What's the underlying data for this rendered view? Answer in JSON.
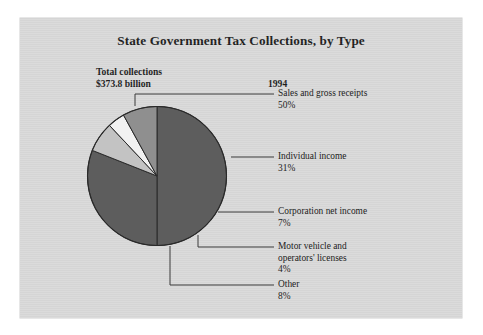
{
  "figure": {
    "title": "State Government Tax Collections, by Type",
    "total_label_line1": "Total collections",
    "total_label_line2": "$373.8 billion",
    "year": "1994",
    "background_color": "#ffffff",
    "panel_color": "#d9d9d9"
  },
  "chart_data": {
    "type": "pie",
    "title": "State Government Tax Collections, by Type",
    "subtitle": "Total collections $373.8 billion",
    "year": "1994",
    "total": "$373.8 billion",
    "unit": "percent",
    "legend_position": "callout-labels-right",
    "grid": false,
    "categories": [
      "Sales and gross receipts",
      "Individual income",
      "Corporation net income",
      "Motor vehicle and operators' licenses",
      "Other"
    ],
    "values": [
      50,
      31,
      7,
      4,
      8
    ],
    "value_labels": [
      "50%",
      "31%",
      "7%",
      "4%",
      "8%"
    ],
    "colors": [
      "#5d5d5d",
      "#5d5d5d",
      "#c3c3c3",
      "#f2f2f2",
      "#8f8f8f"
    ],
    "slices": [
      {
        "label": "Sales and gross receipts",
        "pct_label": "50%",
        "value": 50,
        "color": "#5d5d5d",
        "start_deg": 0,
        "end_deg": 180
      },
      {
        "label": "Individual income",
        "pct_label": "31%",
        "value": 31,
        "color": "#5d5d5d",
        "start_deg": 180,
        "end_deg": 291.6
      },
      {
        "label": "Corporation net income",
        "pct_label": "7%",
        "value": 7,
        "color": "#c3c3c3",
        "start_deg": 291.6,
        "end_deg": 316.8
      },
      {
        "label": "Motor vehicle and operators' licenses",
        "pct_label": "4%",
        "value": 4,
        "color": "#f2f2f2",
        "start_deg": 316.8,
        "end_deg": 331.2
      },
      {
        "label": "Other",
        "pct_label": "8%",
        "value": 8,
        "color": "#8f8f8f",
        "start_deg": 331.2,
        "end_deg": 360
      }
    ]
  },
  "callouts": [
    {
      "name": "sales-and-gross-receipts",
      "label": "Sales and gross receipts",
      "pct": "50%"
    },
    {
      "name": "individual-income",
      "label": "Individual income",
      "pct": "31%"
    },
    {
      "name": "corporation-net-income",
      "label": "Corporation net income",
      "pct": "7%"
    },
    {
      "name": "motor-vehicle-licenses",
      "label_line1": "Motor vehicle and",
      "label_line2": "operators' licenses",
      "pct": "4%"
    },
    {
      "name": "other",
      "label": "Other",
      "pct": "8%"
    }
  ]
}
